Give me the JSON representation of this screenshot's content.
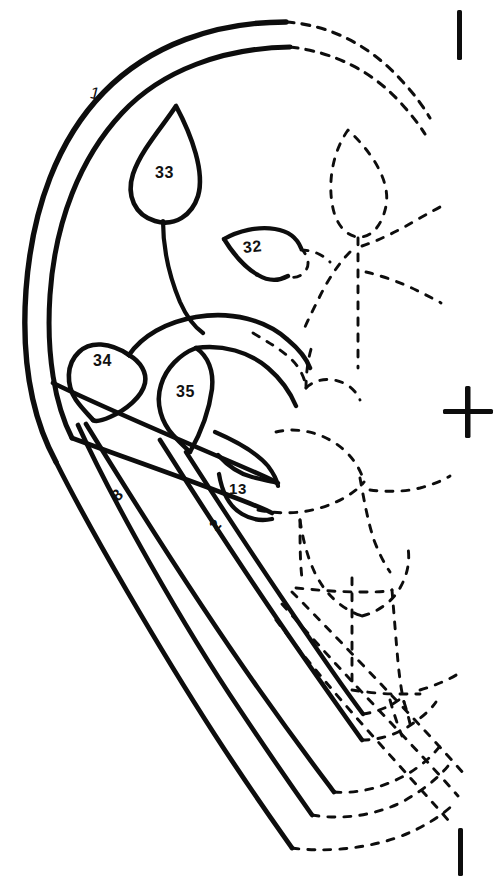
{
  "figure": {
    "background_color": "#ffffff",
    "ink_color": "#0d0d0d",
    "width": 499,
    "height": 885,
    "legend_note": "Solid outlines indicate preserved structures; dashed outlines indicate reconstructed structures."
  },
  "labels": [
    {
      "id": "label-1",
      "text": "1",
      "x": 90,
      "y": 84,
      "part": "outer-bract-margin"
    },
    {
      "id": "label-33",
      "text": "33",
      "x": 155,
      "y": 164,
      "part": "upper-leaflet"
    },
    {
      "id": "label-32",
      "text": "32",
      "x": 243,
      "y": 238,
      "part": "lateral-leaflet"
    },
    {
      "id": "label-34",
      "text": "34",
      "x": 93,
      "y": 352,
      "part": "left-basal-leaflet"
    },
    {
      "id": "label-35",
      "text": "35",
      "x": 176,
      "y": 383,
      "part": "inner-basal-leaflet"
    },
    {
      "id": "label-13",
      "text": "13",
      "x": 229,
      "y": 480,
      "part": "lower-lamina"
    },
    {
      "id": "label-8",
      "text": "8",
      "x": 113,
      "y": 486,
      "part": "outer-vein"
    },
    {
      "id": "label-2",
      "text": "2",
      "x": 211,
      "y": 516,
      "part": "inner-vein"
    }
  ],
  "registration_marks": [
    {
      "id": "tick-top",
      "type": "vertical-tick",
      "x": 460,
      "y": 12,
      "length": 48
    },
    {
      "id": "mark-middle",
      "type": "cross",
      "x": 468,
      "y": 412,
      "size": 52
    },
    {
      "id": "tick-bottom",
      "type": "vertical-tick",
      "x": 461,
      "y": 830,
      "length": 48
    }
  ],
  "strokes": {
    "solid_count": 24,
    "dashed_count": 31
  }
}
